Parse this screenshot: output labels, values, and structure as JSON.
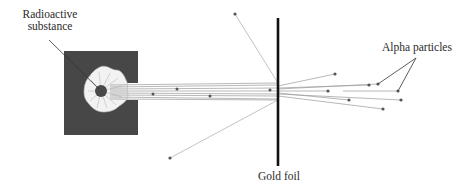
{
  "labels": {
    "source": [
      "Radioactive",
      "substance"
    ],
    "foil": "Gold foil",
    "particles": "Alpha particles"
  },
  "colors": {
    "box": "#474747",
    "flower": "#ffffff",
    "core": "#4a4a4a",
    "foil": "#111111",
    "beam": "#9a9a9a",
    "particle": "#555555",
    "leader": "#333333"
  }
}
